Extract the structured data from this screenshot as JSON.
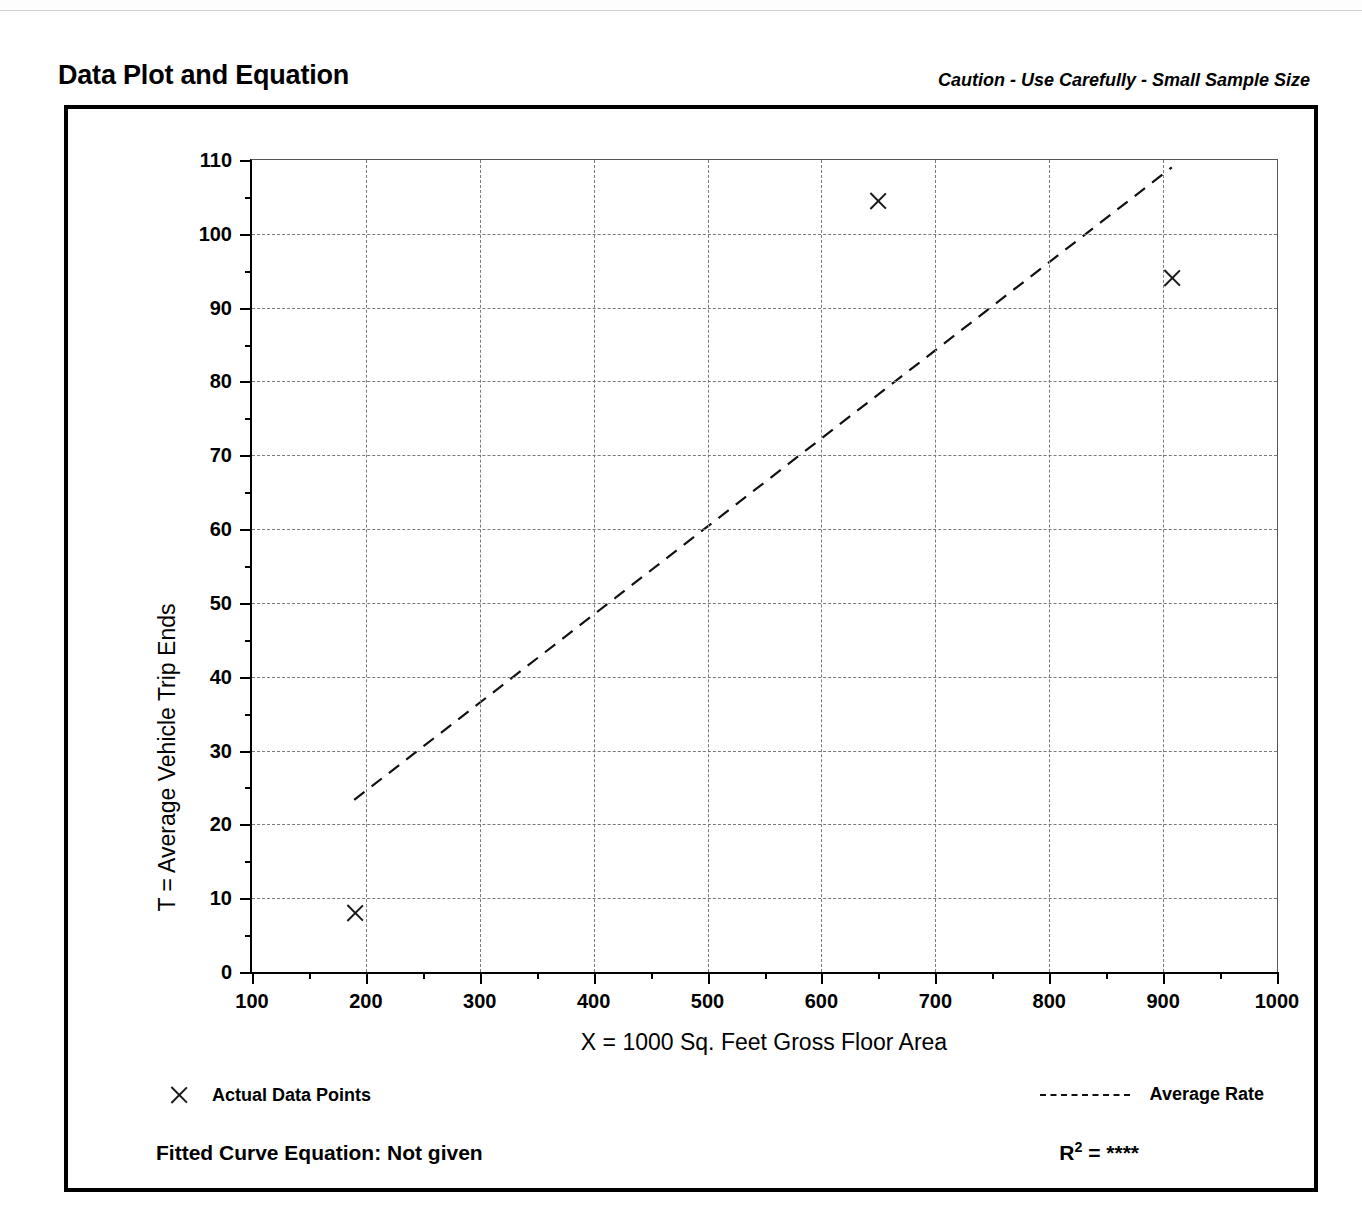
{
  "header": {
    "title": "Data Plot and Equation",
    "caution": "Caution - Use Carefully - Small Sample Size"
  },
  "footer": {
    "fitted_equation_label": "Fitted Curve Equation:  Not given",
    "r_squared_label": "R",
    "r_squared_exp": "2",
    "r_squared_value": "= ****"
  },
  "legend": {
    "points_label": "Actual Data Points",
    "rate_label": "Average Rate",
    "point_marker_icon": "x-marker-icon",
    "rate_line_icon": "dashed-line-icon"
  },
  "chart_data": {
    "type": "scatter",
    "title": "Data Plot and Equation",
    "subtitle": "Caution - Use Carefully - Small Sample Size",
    "xlabel": "X = 1000 Sq. Feet Gross Floor Area",
    "ylabel": "T = Average Vehicle Trip Ends",
    "xlim": [
      100,
      1000
    ],
    "ylim": [
      0,
      110
    ],
    "xticks": [
      100,
      200,
      300,
      400,
      500,
      600,
      700,
      800,
      900,
      1000
    ],
    "yticks": [
      0,
      10,
      20,
      30,
      40,
      50,
      60,
      70,
      80,
      90,
      100,
      110
    ],
    "xminor_step": 50,
    "yminor_step": 5,
    "grid": true,
    "grid_style": "dashed",
    "legend_position": "below-axes",
    "series": [
      {
        "name": "Actual Data Points",
        "type": "scatter",
        "marker": "x",
        "color": "#1a1a1a",
        "points": [
          {
            "x": 190,
            "y": 8
          },
          {
            "x": 650,
            "y": 104.5
          },
          {
            "x": 908,
            "y": 94
          }
        ]
      },
      {
        "name": "Average Rate",
        "type": "line",
        "style": "dashed",
        "color": "#111111",
        "points": [
          {
            "x": 190,
            "y": 23
          },
          {
            "x": 910,
            "y": 109
          }
        ]
      }
    ],
    "fitted_equation": "Not given",
    "r_squared": "****"
  }
}
